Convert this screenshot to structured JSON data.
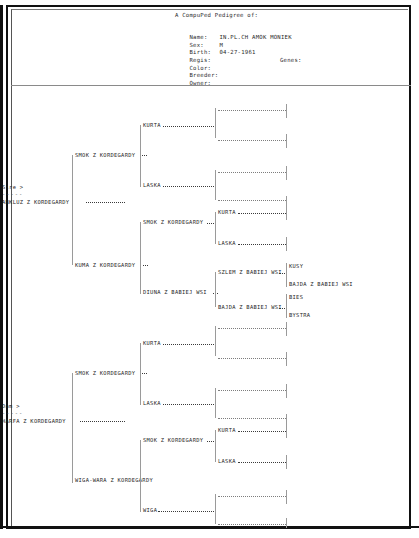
{
  "document": {
    "title": "A CompuPed Pedigree of:",
    "fields": [
      {
        "label": "Name:",
        "value": "IN.PL.CH AMOK MONIEK"
      },
      {
        "label": "Sex:",
        "value": "M"
      },
      {
        "label": "Birth:",
        "value": "04-27-1961"
      },
      {
        "label": "Regis:",
        "value": ""
      },
      {
        "label": "Color:",
        "value": ""
      },
      {
        "label": "Breeder:",
        "value": ""
      },
      {
        "label": "Owner:",
        "value": ""
      }
    ],
    "genes_label": "Genes:"
  },
  "pedigree": {
    "sire_marker": "Sire >",
    "dam_marker": "Dam >",
    "sire_name": "ANKLUZ Z KORDEGARDY",
    "dam_name": "HARFA Z KORDEGARDY",
    "dots": "-----",
    "sire_branch": {
      "gen2_top": "SMOK Z KORDEGARDY",
      "gen2_bottom": "KUMA Z KORDEGARDY",
      "gen3": [
        "KURTA",
        "LASKA",
        "SMOK Z KORDEGARDY",
        "DIUNA Z BABIEJ WSI"
      ],
      "gen4_smok": [
        "KURTA",
        "LASKA"
      ],
      "gen4_diuna": [
        "SZLEM Z BABIEJ WSI",
        "BAJDA Z BABIEJ WSI"
      ],
      "gen5_szlem": [
        "KUSY",
        "BAJDA Z BABIEJ WSI"
      ],
      "gen5_bajda": [
        "BIES",
        "BYSTRA"
      ]
    },
    "dam_branch": {
      "gen2_top": "SMOK Z KORDEGARDY",
      "gen2_bottom": "WIGA-WARA Z KORDEGARDY",
      "gen3": [
        "KURTA",
        "LASKA",
        "SMOK Z KORDEGARDY",
        "WIGA"
      ],
      "gen4_smok": [
        "KURTA",
        "LASKA"
      ]
    }
  }
}
